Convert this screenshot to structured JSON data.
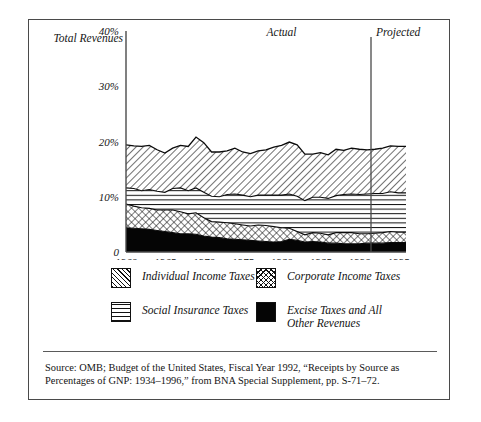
{
  "figure": {
    "total_revenues_label": "Total Revenues",
    "period_actual": "Actual",
    "period_projected": "Projected"
  },
  "legend": {
    "items": [
      {
        "label": "Individual Income Taxes",
        "pattern": "diagonal-hatch",
        "swatch_class": "sw-diag"
      },
      {
        "label": "Social Insurance Taxes",
        "pattern": "horizontal-lines",
        "swatch_class": "sw-hline"
      },
      {
        "label": "Corporate Income Taxes",
        "pattern": "crosshatch-diamond",
        "swatch_class": "sw-cross"
      },
      {
        "label": "Excise Taxes and All\nOther Revenues",
        "pattern": "solid-black",
        "swatch_class": "sw-solid"
      }
    ]
  },
  "source": {
    "text": "Source: OMB; Budget of the United States, Fiscal Year 1992, “Receipts by Source as Percentages of GNP: 1934–1996,” from BNA Special Supplement, pp. S-71–72."
  },
  "chart_data": {
    "type": "area",
    "title": "",
    "subtitle": "",
    "xlabel": "",
    "ylabel": "Total Revenues",
    "stacked": true,
    "grid": false,
    "legend_position": "below",
    "xlim": [
      1960,
      1996
    ],
    "ylim": [
      0,
      40
    ],
    "ytick_labels": [
      "0",
      "10%",
      "20%",
      "30%",
      "40%"
    ],
    "ytick_values": [
      0,
      10,
      20,
      30,
      40
    ],
    "xtick_labels": [
      "1960",
      "1965",
      "1970",
      "1975",
      "1980",
      "1985",
      "1990",
      "1995"
    ],
    "xtick_values": [
      1960,
      1965,
      1970,
      1975,
      1980,
      1985,
      1990,
      1995
    ],
    "annotations": [
      {
        "text": "Actual",
        "x": 1980,
        "y": 39
      },
      {
        "text": "Projected",
        "x": 1993.5,
        "y": 39
      },
      {
        "text": "Total Revenues",
        "x": 1959,
        "y": 38.5
      }
    ],
    "divider": {
      "x": 1991.5,
      "label_left": "Actual",
      "label_right": "Projected"
    },
    "x": [
      1960,
      1961,
      1962,
      1963,
      1964,
      1965,
      1966,
      1967,
      1968,
      1969,
      1970,
      1971,
      1972,
      1973,
      1974,
      1975,
      1976,
      1977,
      1978,
      1979,
      1980,
      1981,
      1982,
      1983,
      1984,
      1985,
      1986,
      1987,
      1988,
      1989,
      1990,
      1991,
      1992,
      1993,
      1994,
      1995,
      1996
    ],
    "series": [
      {
        "name": "Excise Taxes and All Other Revenues",
        "pattern": "solid-black",
        "values": [
          4.4,
          4.3,
          4.2,
          4.1,
          3.9,
          3.7,
          3.5,
          3.3,
          3.3,
          3.2,
          2.9,
          2.7,
          2.6,
          2.4,
          2.3,
          2.2,
          2.1,
          2.0,
          1.9,
          1.8,
          1.9,
          2.3,
          2.1,
          1.8,
          1.9,
          1.8,
          1.6,
          1.6,
          1.5,
          1.5,
          1.5,
          1.6,
          1.6,
          1.6,
          1.7,
          1.7,
          1.7
        ]
      },
      {
        "name": "Corporate Income Taxes",
        "pattern": "crosshatch-diamond",
        "values": [
          4.3,
          4.0,
          3.8,
          3.8,
          3.7,
          3.9,
          4.1,
          4.0,
          3.6,
          3.9,
          3.3,
          2.8,
          2.8,
          2.9,
          2.8,
          2.7,
          2.6,
          2.9,
          2.9,
          2.8,
          2.5,
          2.0,
          1.6,
          1.3,
          1.6,
          1.6,
          1.5,
          1.9,
          2.0,
          2.0,
          1.8,
          1.7,
          1.8,
          1.9,
          2.0,
          1.9,
          1.9
        ]
      },
      {
        "name": "Social Insurance Taxes",
        "pattern": "horizontal-lines",
        "values": [
          2.9,
          3.2,
          3.1,
          3.4,
          3.4,
          3.2,
          3.9,
          4.3,
          4.2,
          4.5,
          4.6,
          4.6,
          4.6,
          5.1,
          5.4,
          5.4,
          5.3,
          5.4,
          5.5,
          5.7,
          5.9,
          6.2,
          6.4,
          6.2,
          6.4,
          6.5,
          6.6,
          6.7,
          6.9,
          7.0,
          7.1,
          7.2,
          7.2,
          7.1,
          7.2,
          7.1,
          7.1
        ]
      },
      {
        "name": "Individual Income Taxes",
        "pattern": "diagonal-hatch",
        "values": [
          7.8,
          7.7,
          8.0,
          8.0,
          7.5,
          7.1,
          7.3,
          7.7,
          8.0,
          9.2,
          9.0,
          8.0,
          8.1,
          7.9,
          8.3,
          7.8,
          7.8,
          8.0,
          8.2,
          8.7,
          9.0,
          9.4,
          9.3,
          8.4,
          7.8,
          8.1,
          7.9,
          8.4,
          8.0,
          8.3,
          8.2,
          8.0,
          8.0,
          8.2,
          8.3,
          8.4,
          8.4
        ]
      }
    ],
    "total_revenues": [
      19.4,
      19.2,
      19.1,
      19.3,
      18.5,
      17.9,
      18.8,
      19.3,
      19.1,
      20.8,
      19.8,
      18.1,
      18.1,
      18.3,
      18.8,
      18.1,
      17.8,
      18.3,
      18.5,
      19.0,
      19.3,
      19.9,
      19.4,
      17.7,
      17.7,
      18.0,
      17.6,
      18.6,
      18.4,
      18.8,
      18.6,
      18.5,
      18.6,
      18.8,
      19.2,
      19.1,
      19.1
    ]
  }
}
